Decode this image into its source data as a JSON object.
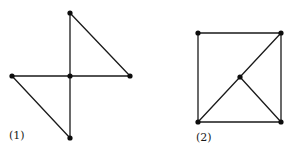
{
  "figures": [
    {
      "label": "(1)",
      "label_pos": [
        9,
        139
      ],
      "vertices": [
        {
          "id": "top",
          "x": 70,
          "y": 13
        },
        {
          "id": "left",
          "x": 12,
          "y": 76
        },
        {
          "id": "center",
          "x": 70,
          "y": 76
        },
        {
          "id": "right",
          "x": 130,
          "y": 76
        },
        {
          "id": "bottom",
          "x": 70,
          "y": 138
        }
      ],
      "edges": [
        [
          "top",
          "center"
        ],
        [
          "center",
          "bottom"
        ],
        [
          "left",
          "center"
        ],
        [
          "center",
          "right"
        ],
        [
          "top",
          "right"
        ],
        [
          "left",
          "bottom"
        ]
      ]
    },
    {
      "label": "(2)",
      "label_pos": [
        196,
        141
      ],
      "vertices": [
        {
          "id": "top-left",
          "x": 198,
          "y": 33
        },
        {
          "id": "top-right",
          "x": 281,
          "y": 33
        },
        {
          "id": "bottom-left",
          "x": 198,
          "y": 122
        },
        {
          "id": "bottom-right",
          "x": 281,
          "y": 122
        },
        {
          "id": "center",
          "x": 240,
          "y": 77
        }
      ],
      "edges": [
        [
          "top-left",
          "top-right"
        ],
        [
          "top-left",
          "bottom-left"
        ],
        [
          "top-right",
          "bottom-right"
        ],
        [
          "bottom-left",
          "bottom-right"
        ],
        [
          "bottom-left",
          "center"
        ],
        [
          "center",
          "top-right"
        ],
        [
          "center",
          "bottom-right"
        ]
      ]
    }
  ],
  "colors": {
    "background": "#ffffff",
    "stroke": "#1a1a1a",
    "vertex": "#0d0d0d"
  }
}
